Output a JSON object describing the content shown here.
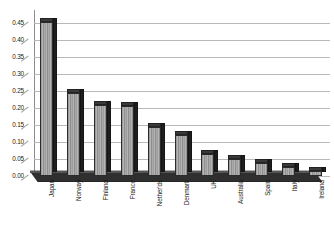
{
  "chart_data": {
    "type": "bar",
    "title": "",
    "subtitle": "",
    "xlabel": "",
    "ylabel": "",
    "categories": [
      "Japan",
      "Norway",
      "Finland",
      "France",
      "Nether'ds",
      "Denmark",
      "UK",
      "Australia",
      "Spain",
      "Italy",
      "Ireland"
    ],
    "values": [
      0.452,
      0.243,
      0.208,
      0.206,
      0.143,
      0.119,
      0.064,
      0.05,
      0.037,
      0.025,
      0.016
    ],
    "ylim": [
      0.0,
      0.475
    ],
    "y_ticks": [
      0.0,
      0.05,
      0.1,
      0.15,
      0.2,
      0.25,
      0.3,
      0.35,
      0.4,
      0.45
    ],
    "y_tick_labels": [
      "0.00",
      "0.05",
      "0.10",
      "0.15",
      "0.20",
      "0.25",
      "0.30",
      "0.35",
      "0.40",
      "0.45"
    ],
    "grid": true,
    "grid_axis": "y",
    "legend": false,
    "legend_position": "none",
    "style": "3d-column",
    "annotations": [],
    "colors": {
      "bar_face": "#a5a5a5",
      "bar_side": "#1e1e1e",
      "bar_top": "#3a3a3a",
      "bar_outline": "#2b2b2b",
      "gridline": "#b9b9b9",
      "axis": "#8d8d8d",
      "floor": "#2f2f2f",
      "background": "#ffffff",
      "text": "#1a1a1a"
    }
  }
}
